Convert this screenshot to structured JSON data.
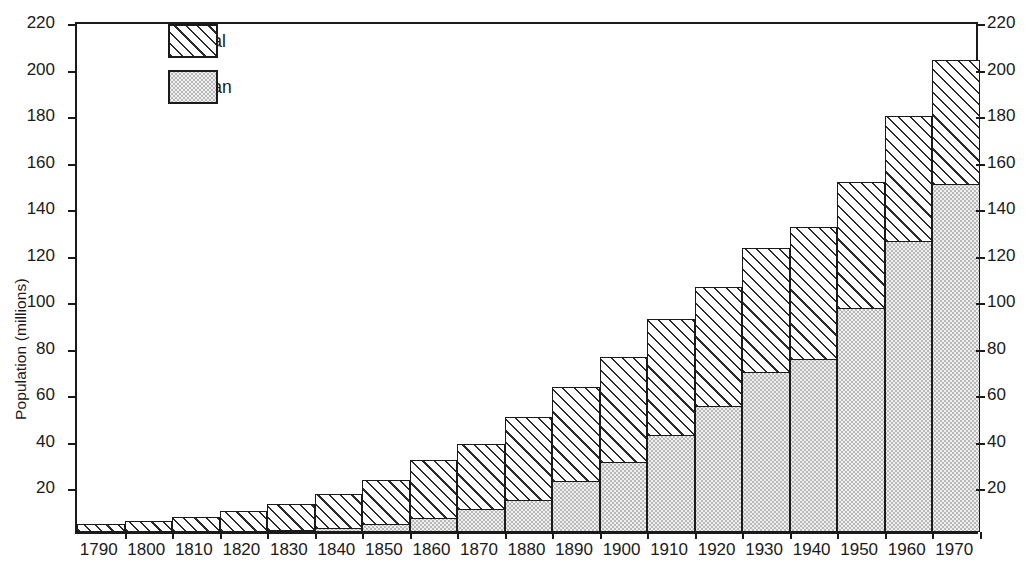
{
  "chart_data": {
    "type": "bar",
    "subtype": "stacked",
    "title": "",
    "subtitle": "",
    "xlabel": "",
    "ylabel": "Population (millions)",
    "categories": [
      "1790",
      "1800",
      "1810",
      "1820",
      "1830",
      "1840",
      "1850",
      "1860",
      "1870",
      "1880",
      "1890",
      "1900",
      "1910",
      "1920",
      "1930",
      "1940",
      "1950",
      "1960",
      "1970"
    ],
    "series": [
      {
        "name": "Urban",
        "pattern": "stipple",
        "values": [
          0.2,
          0.3,
          0.5,
          0.7,
          1.1,
          1.8,
          3.5,
          6.2,
          9.9,
          14.1,
          22.1,
          30.2,
          42.0,
          54.2,
          69.0,
          74.4,
          96.5,
          125.3,
          149.6
        ]
      },
      {
        "name": "Rural",
        "pattern": "diagonal-hatch",
        "values": [
          3.7,
          4.9,
          6.7,
          8.9,
          11.7,
          15.2,
          19.6,
          25.2,
          28.7,
          36.0,
          40.8,
          45.8,
          50.0,
          51.6,
          53.8,
          57.2,
          54.5,
          54.0,
          53.9
        ]
      }
    ],
    "totals": [
      3.9,
      5.2,
      7.2,
      9.6,
      12.8,
      17.0,
      23.1,
      31.4,
      38.6,
      50.1,
      62.9,
      76.0,
      92.0,
      105.8,
      122.8,
      131.6,
      151.0,
      179.3,
      203.5
    ],
    "ylim": [
      0,
      220
    ],
    "ytick_step": 20,
    "yticks": [
      0,
      20,
      40,
      60,
      80,
      100,
      120,
      140,
      160,
      180,
      200,
      220
    ],
    "yticks_labeled": [
      20,
      40,
      60,
      80,
      100,
      120,
      140,
      160,
      180,
      200,
      220
    ],
    "right_axis": {
      "mirror": true,
      "yticks_labeled": [
        20,
        40,
        60,
        80,
        100,
        120,
        140,
        160,
        180,
        200,
        220
      ]
    },
    "grid": false,
    "legend": {
      "position": "top-left-inside",
      "entries": [
        {
          "label": "Rural",
          "pattern": "diagonal-hatch"
        },
        {
          "label": "Urban",
          "pattern": "stipple"
        }
      ]
    },
    "colors": {
      "ink": "#1a1a1a",
      "rural_fill": "#ffffff",
      "rural_hatch": "#2b2b2b",
      "urban_fill": "#f0f0f0",
      "urban_dots": "#5a5a5a",
      "background": "#ffffff"
    }
  }
}
